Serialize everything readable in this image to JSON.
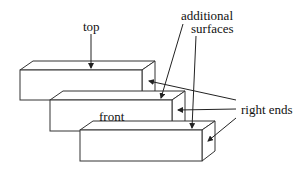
{
  "diagram": {
    "type": "stacked-blocks-illustration",
    "stroke_color": "#333333",
    "labels": {
      "top": "top",
      "additional_line1": "additional",
      "additional_line2": "surfaces",
      "front": "front",
      "right_ends": "right ends"
    },
    "blocks": [
      {
        "name": "block-1"
      },
      {
        "name": "block-2"
      },
      {
        "name": "block-3"
      }
    ]
  }
}
